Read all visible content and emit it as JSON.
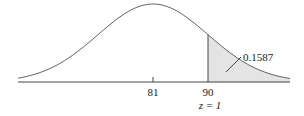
{
  "chart_data": {
    "type": "area",
    "title": "",
    "distribution": "normal",
    "mean": 81,
    "sd": 9,
    "xlabel": "",
    "ylabel": "",
    "tick_labels": [
      "81",
      "90"
    ],
    "z_label": "z = 1",
    "shaded_region": {
      "from": 90,
      "to": "inf",
      "area": 0.1587
    },
    "annotations": [
      "0.1587"
    ],
    "grid": false,
    "legend": "none"
  },
  "labels": {
    "mean": "81",
    "cutoff": "90",
    "z": "z = 1",
    "area": "0.1587"
  },
  "colors": {
    "shade": "#e4e4e4",
    "stroke": "#555555"
  }
}
